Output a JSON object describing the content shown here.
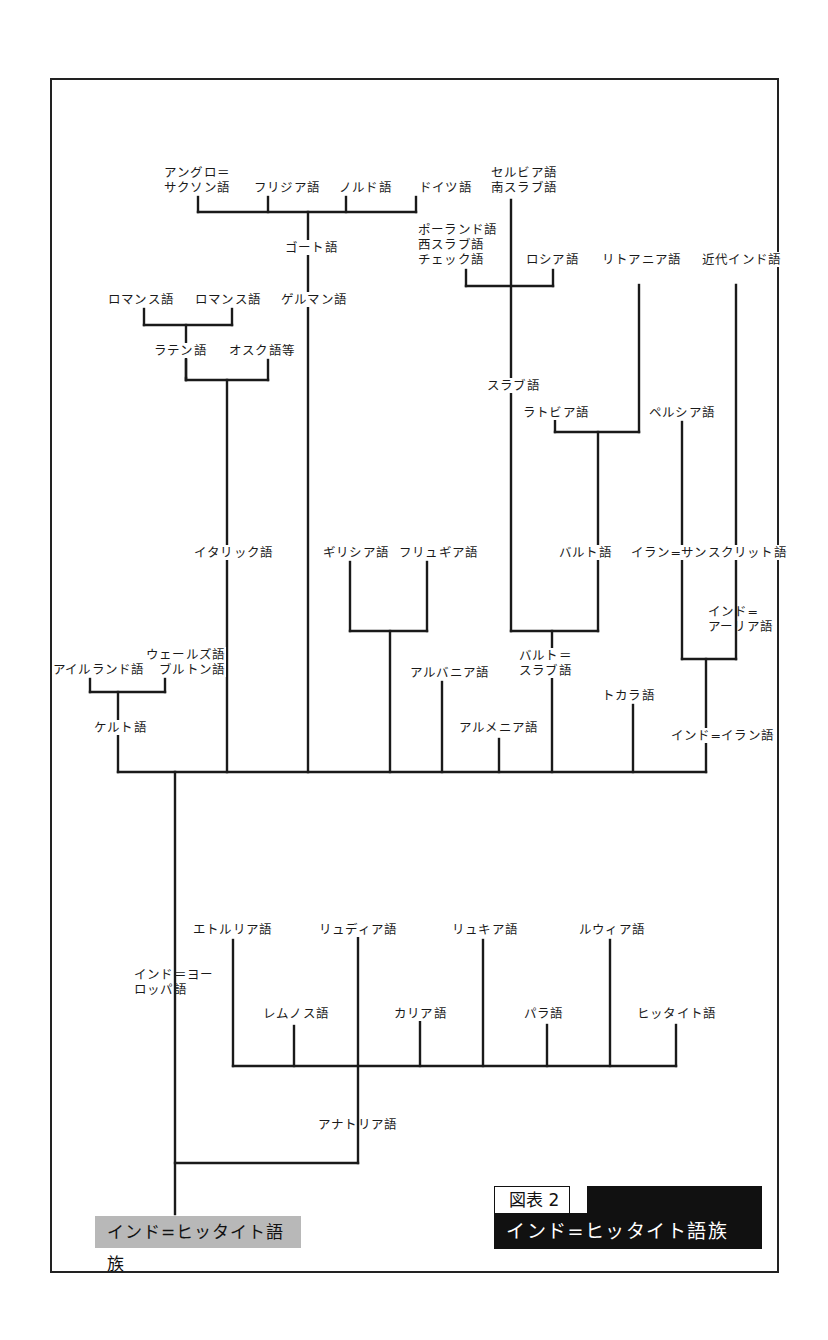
{
  "figure": {
    "number_label": "図表 2",
    "title": "インド=ヒッタイト語族"
  },
  "root": {
    "label": "インド=ヒッタイト語族",
    "fill_color": "#b8b8b8"
  },
  "colors": {
    "line": "#1a1a1a",
    "title_bg": "#111111",
    "title_text": "#ffffff"
  },
  "tree": {
    "indo_european": {
      "label": "インド=ヨーロッパ語",
      "celtic": {
        "label": "ケルト語",
        "children": [
          "アイルランド語",
          "ウェールズ語 ブルトン語"
        ]
      },
      "italic": {
        "label": "イタリック語",
        "latin": {
          "label": "ラテン語",
          "children": [
            "ロマンス語",
            "ロマンス語"
          ]
        },
        "oscan": {
          "label": "オスク語等"
        }
      },
      "germanic": {
        "label": "ゲルマン語",
        "gothic": {
          "label": "ゴート語",
          "children": [
            "アングロ=サクソン語",
            "フリジア語",
            "ノルド語",
            "ドイツ語"
          ]
        }
      },
      "greek_phrygian": {
        "children": [
          "ギリシア語",
          "フリュギア語"
        ]
      },
      "albanian": {
        "label": "アルバニア語"
      },
      "armenian": {
        "label": "アルメニア語"
      },
      "balto_slavic": {
        "label": "バルト=スラブ語",
        "slavic": {
          "label": "スラブ語",
          "children": [
            "セルビア語 南スラブ語",
            "ポーランド語 西スラブ語 チェック語",
            "ロシア語"
          ]
        },
        "baltic": {
          "label": "バルト語",
          "children": [
            "ラトビア語",
            "リトアニア語"
          ]
        }
      },
      "tocharian": {
        "label": "トカラ語"
      },
      "indo_iranian": {
        "label": "インド=イラン語",
        "iranian_sanskrit": {
          "label": "イラン=サンスクリット語"
        },
        "indo_aryan": {
          "label": "インド=アーリア語"
        },
        "children": [
          "ペルシア語",
          "近代インド語"
        ]
      }
    },
    "anatolian": {
      "label": "アナトリア語",
      "children": [
        "エトルリア語",
        "レムノス語",
        "リュディア語",
        "カリア語",
        "リュキア語",
        "パラ語",
        "ルウィア語",
        "ヒッタイト語"
      ]
    }
  },
  "labels": {
    "anglo_saxon": "アングロ＝\nサクソン語",
    "anglo_saxon_l1": "アングロ＝",
    "anglo_saxon_l2": "サクソン語",
    "frisian": "フリジア語",
    "norse": "ノルド語",
    "german": "ドイツ語",
    "serbian_l1": "セルビア語",
    "serbian_l2": "南スラブ語",
    "polish_l1": "ポーランド語",
    "polish_l2": "西スラブ語",
    "polish_l3": "チェック語",
    "russian": "ロシア語",
    "lithuanian": "リトアニア語",
    "modern_indic": "近代インド語",
    "gothic": "ゴート語",
    "germanic": "ゲルマン語",
    "romance1": "ロマンス語",
    "romance2": "ロマンス語",
    "latin": "ラテン語",
    "oscan": "オスク語等",
    "slavic": "スラブ語",
    "latvian": "ラトビア語",
    "persian": "ペルシア語",
    "italic": "イタリック語",
    "greek": "ギリシア語",
    "phrygian": "フリュギア語",
    "baltic": "バルト語",
    "iran_sanskrit": "イラン=サンスクリット語",
    "indo_aryan_l1": "インド=",
    "indo_aryan_l2": "アーリア語",
    "welsh": "ウェールズ語",
    "breton": "ブルトン語",
    "irish": "アイルランド語",
    "albanian": "アルバニア語",
    "balto_slavic_l1": "バルト＝",
    "balto_slavic_l2": "スラブ語",
    "tocharian": "トカラ語",
    "celtic": "ケルト語",
    "armenian": "アルメニア語",
    "indo_iranian": "インド=イラン語",
    "etruscan": "エトルリア語",
    "lydian": "リュディア語",
    "lycian": "リュキア語",
    "luwian": "ルウィア語",
    "indo_european_l1": "インド＝ヨー",
    "indo_european_l2": "ロッパ語",
    "lemnian": "レムノス語",
    "carian": "カリア語",
    "palaic": "パラ語",
    "hittite": "ヒッタイト語",
    "anatolian": "アナトリア語"
  }
}
